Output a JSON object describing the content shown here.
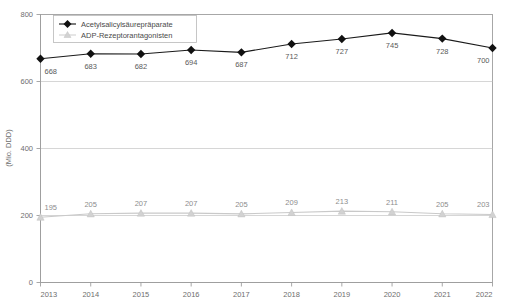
{
  "chart_data": {
    "type": "line",
    "title": "",
    "subtitle": "",
    "xlabel": "",
    "ylabel": "(Mio. DDD)",
    "categories": [
      "2013",
      "2014",
      "2015",
      "2016",
      "2017",
      "2018",
      "2019",
      "2020",
      "2021",
      "2022"
    ],
    "ylim": [
      0,
      800
    ],
    "yticks": [
      0,
      200,
      400,
      600,
      800
    ],
    "ytick_labels": [
      "0",
      "200",
      "400",
      "600",
      "800"
    ],
    "grid": true,
    "grid_axis": "y",
    "legend_position": "top-left",
    "series": [
      {
        "name": "Acetylsalicylsäurepräparate",
        "marker": "diamond",
        "color": "#111111",
        "values": [
          668,
          683,
          682,
          694,
          687,
          712,
          727,
          745,
          728,
          700
        ],
        "labels": [
          "668",
          "683",
          "682",
          "694",
          "687",
          "712",
          "727",
          "745",
          "728",
          "700"
        ]
      },
      {
        "name": "ADP-Rezeptorantagonisten",
        "marker": "triangle",
        "color": "#d2d2d2",
        "values": [
          195,
          205,
          207,
          207,
          205,
          209,
          213,
          211,
          205,
          203
        ],
        "labels": [
          "195",
          "205",
          "207",
          "207",
          "205",
          "209",
          "213",
          "211",
          "205",
          "203"
        ]
      }
    ]
  },
  "legend": {
    "items": [
      {
        "label": "Acetylsalicylsäurepräparate",
        "marker": "diamond-marker-icon"
      },
      {
        "label": "ADP-Rezeptorantagonisten",
        "marker": "triangle-marker-icon"
      }
    ]
  },
  "colors": {
    "series_a": "#111111",
    "series_b": "#d2d2d2",
    "grid": "#c4c4c4",
    "axis": "#9e9e9e",
    "text": "#6e6e6e",
    "background": "#ffffff"
  }
}
